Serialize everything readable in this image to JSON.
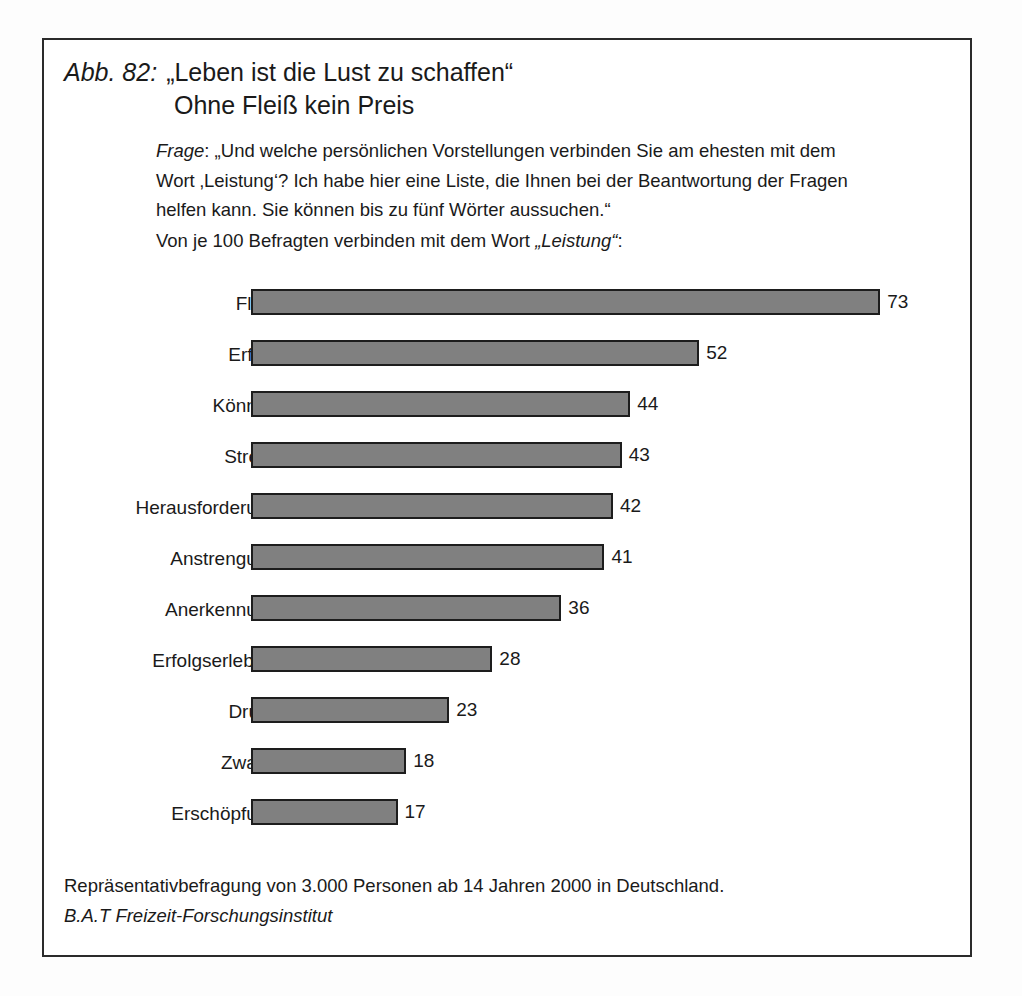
{
  "figure": {
    "number_label": "Abb. 82:",
    "title_line1": "„Leben ist die Lust zu schaffen“",
    "title_line2": "Ohne Fleiß kein Preis"
  },
  "question": {
    "prefix": "Frage",
    "line1_rest": ": „Und welche persönlichen Vorstellungen verbinden Sie am ehesten mit dem",
    "line2": "Wort ‚Leistung‘? Ich habe hier eine Liste, die Ihnen bei der Beantwortung der Fragen",
    "line3": "helfen kann. Sie können bis zu fünf Wörter aussuchen.“",
    "intro_before": "Von je 100 Befragten verbinden mit dem Wort ",
    "intro_emphasis": "„Leistung“",
    "intro_after": ":"
  },
  "footer": {
    "methodology": "Repräsentativbefragung von 3.000 Personen ab 14 Jahren 2000 in Deutschland.",
    "source": "B.A.T Freizeit-Forschungsinstitut"
  },
  "style": {
    "bar_fill": "#808080",
    "bar_stroke": "#1d1d1d",
    "frame_stroke": "#2b2b2b",
    "page_background": "#fdfdfd",
    "text_color": "#1a1a1a"
  },
  "chart_data": {
    "type": "bar",
    "orientation": "horizontal",
    "subtitle": "Von je 100 Befragten verbinden mit dem Wort „Leistung“:",
    "xlabel": "",
    "ylabel": "",
    "unit": "von je 100 Befragten",
    "xlim": [
      0,
      73
    ],
    "grid": false,
    "legend": false,
    "axis_visible": false,
    "value_labels": true,
    "pixels_per_unit": 8.62,
    "categories": [
      "Fleiß",
      "Erfolg",
      "Können",
      "Stress",
      "Herausforderung",
      "Anstrengung",
      "Anerkennung",
      "Erfolgserlebnis",
      "Druck",
      "Zwang",
      "Erschöpfung"
    ],
    "values": [
      73,
      52,
      44,
      43,
      42,
      41,
      36,
      28,
      23,
      18,
      17
    ],
    "bars": [
      {
        "label": "Fleiß",
        "value": 73
      },
      {
        "label": "Erfolg",
        "value": 52
      },
      {
        "label": "Können",
        "value": 44
      },
      {
        "label": "Stress",
        "value": 43
      },
      {
        "label": "Herausforderung",
        "value": 42
      },
      {
        "label": "Anstrengung",
        "value": 41
      },
      {
        "label": "Anerkennung",
        "value": 36
      },
      {
        "label": "Erfolgserlebnis",
        "value": 28
      },
      {
        "label": "Druck",
        "value": 23
      },
      {
        "label": "Zwang",
        "value": 18
      },
      {
        "label": "Erschöpfung",
        "value": 17
      }
    ]
  }
}
